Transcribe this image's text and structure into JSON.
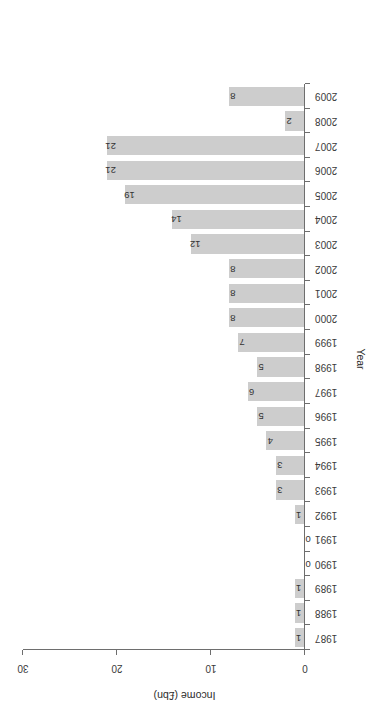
{
  "chart_data": {
    "type": "bar",
    "orientation": "horizontal",
    "title": "",
    "subtitle": "",
    "xlabel": "Income (£bn)",
    "ylabel": "Year",
    "categories": [
      "1987",
      "1988",
      "1989",
      "1990",
      "1991",
      "1992",
      "1993",
      "1994",
      "1995",
      "1996",
      "1997",
      "1998",
      "1999",
      "2000",
      "2001",
      "2002",
      "2003",
      "2004",
      "2005",
      "2006",
      "2007",
      "2008",
      "2009"
    ],
    "values": [
      1,
      1,
      1,
      0,
      0,
      1,
      3,
      3,
      4,
      5,
      6,
      5,
      7,
      8,
      8,
      8,
      12,
      14,
      19,
      21,
      21,
      2,
      8
    ],
    "data_labels": [
      "1",
      "1",
      "1",
      "0",
      "0",
      "1",
      "3",
      "3",
      "4",
      "5",
      "6",
      "5",
      "7",
      "8",
      "8",
      "8",
      "12",
      "14",
      "19",
      "21",
      "21",
      "2",
      "8"
    ],
    "value_axis_ticks": [
      0,
      10,
      20,
      30
    ],
    "value_axis_tick_labels": [
      "0",
      "10",
      "20",
      "30"
    ],
    "xlim": [
      0,
      30
    ],
    "grid": false,
    "legend": false,
    "legend_position": "none",
    "series": [
      {
        "name": "Income (£bn)",
        "values": [
          1,
          1,
          1,
          0,
          0,
          1,
          3,
          3,
          4,
          5,
          6,
          5,
          7,
          8,
          8,
          8,
          12,
          14,
          19,
          21,
          21,
          2,
          8
        ]
      }
    ]
  },
  "style": {
    "bar_color": "#cdcdcd",
    "axis_color": "#6e6e6e",
    "text_color": "#2b2b2b",
    "background": "#ffffff"
  },
  "rotation": {
    "note": "figure rendered rotated 180 degrees",
    "degrees": "180"
  }
}
